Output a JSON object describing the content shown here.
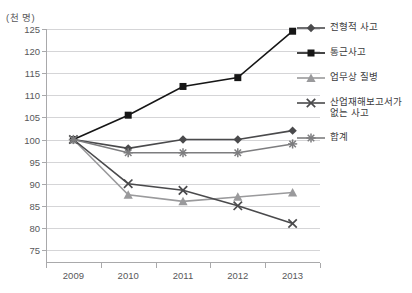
{
  "chart": {
    "title": "",
    "y_axis_unit": "(천 명)"
  },
  "chart_data": {
    "type": "line",
    "title": "",
    "xlabel": "",
    "ylabel": "(천 명)",
    "ylim": [
      75,
      125
    ],
    "ytick_step": 5,
    "yticks": [
      125,
      120,
      115,
      110,
      105,
      100,
      95,
      90,
      85,
      80,
      75
    ],
    "grid": true,
    "legend_position": "right",
    "categories": [
      "2009",
      "2010",
      "2011",
      "2012",
      "2013"
    ],
    "series": [
      {
        "name": "전형적 사고",
        "marker": "diamond",
        "color": "#4a4a4c",
        "values": [
          100,
          98,
          100,
          100,
          102
        ]
      },
      {
        "name": "통근사고",
        "marker": "square",
        "color": "#161616",
        "values": [
          100,
          105.5,
          112,
          114,
          124.5
        ]
      },
      {
        "name": "업무상 질병",
        "marker": "triangle",
        "color": "#9a9a9c",
        "values": [
          100,
          87.5,
          86,
          87,
          88
        ]
      },
      {
        "name": "산업재해보고서가\n없는 사고",
        "marker": "x",
        "color": "#4a4a4c",
        "values": [
          100,
          90,
          88.5,
          85,
          81
        ]
      },
      {
        "name": "합계",
        "marker": "asterisk",
        "color": "#7d7d7f",
        "values": [
          100,
          97,
          97,
          97,
          99
        ]
      }
    ]
  }
}
